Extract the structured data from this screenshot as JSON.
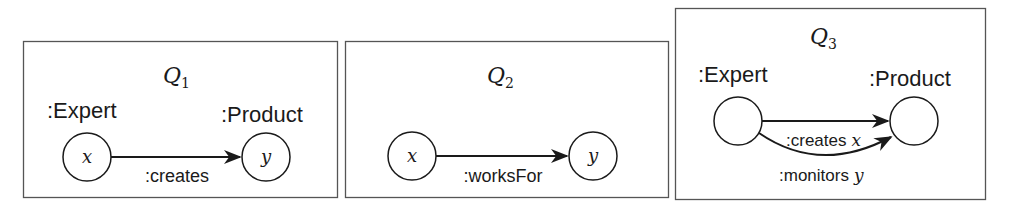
{
  "panels": [
    {
      "title": "Q",
      "subscript": "1",
      "source_label": ":Expert",
      "target_label": ":Product",
      "source_var": "x",
      "target_var": "y",
      "edges": [
        {
          "label": ":creates",
          "var": ""
        }
      ]
    },
    {
      "title": "Q",
      "subscript": "2",
      "source_label": "",
      "target_label": "",
      "source_var": "x",
      "target_var": "y",
      "edges": [
        {
          "label": ":worksFor",
          "var": ""
        }
      ]
    },
    {
      "title": "Q",
      "subscript": "3",
      "source_label": ":Expert",
      "target_label": ":Product",
      "source_var": "",
      "target_var": "",
      "edges": [
        {
          "label": ":creates",
          "var": "x"
        },
        {
          "label": ":monitors",
          "var": "y"
        }
      ]
    }
  ],
  "colors": {
    "stroke": "#1a1a1a",
    "background": "#ffffff",
    "border": "#555555"
  }
}
